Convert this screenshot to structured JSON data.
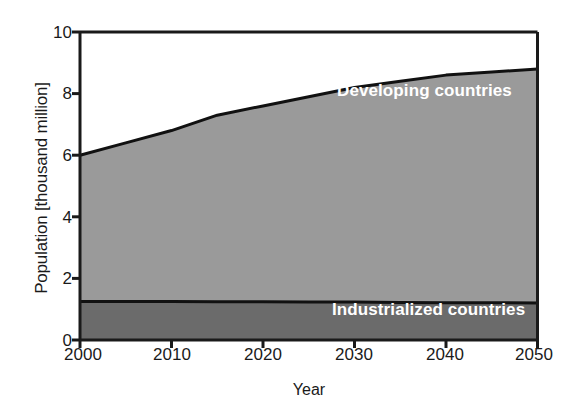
{
  "chart_data": {
    "type": "area",
    "title": "",
    "subtitle": "",
    "xlabel": "Year",
    "ylabel": "Population [thousand million]",
    "xlim": [
      2000,
      2050
    ],
    "ylim": [
      0,
      10
    ],
    "xticks": [
      2000,
      2010,
      2020,
      2030,
      2040,
      2050
    ],
    "yticks": [
      0,
      2,
      4,
      6,
      8,
      10
    ],
    "grid": false,
    "legend_position": "in-plot-annotations",
    "stacked": true,
    "x": [
      2000,
      2005,
      2010,
      2015,
      2020,
      2025,
      2030,
      2035,
      2040,
      2045,
      2050
    ],
    "series": [
      {
        "name": "Industrialized countries",
        "color": "#6b6b6b",
        "values": [
          1.25,
          1.25,
          1.25,
          1.24,
          1.24,
          1.23,
          1.23,
          1.22,
          1.21,
          1.21,
          1.2
        ]
      },
      {
        "name": "Developing countries",
        "color": "#9a9a9a",
        "values": [
          4.75,
          5.15,
          5.55,
          6.06,
          6.36,
          6.67,
          6.97,
          7.18,
          7.39,
          7.49,
          7.6
        ]
      }
    ],
    "total_population": [
      6.0,
      6.4,
      6.8,
      7.3,
      7.6,
      7.9,
      8.2,
      8.4,
      8.6,
      8.7,
      8.8
    ],
    "annotations": [
      {
        "text": "Developing countries",
        "x": 2033,
        "y": 7.4
      },
      {
        "text": "Industrialized countries",
        "x": 2032,
        "y": 0.85
      }
    ]
  },
  "axes": {
    "y_title": "Population [thousand million]",
    "x_title": "Year",
    "y_tick_labels": [
      "10",
      "8",
      "6",
      "4",
      "2",
      "0"
    ],
    "x_tick_labels": [
      "2000",
      "2010",
      "2020",
      "2030",
      "2040",
      "2050"
    ]
  },
  "labels": {
    "developing": "Developing countries",
    "industrialized": "Industrialized countries"
  },
  "colors": {
    "developing_fill": "#9a9a9a",
    "industrialized_fill": "#6b6b6b",
    "axis": "#1a1a1a",
    "curve": "#111111",
    "background": "#ffffff",
    "label_text": "#ffffff"
  }
}
